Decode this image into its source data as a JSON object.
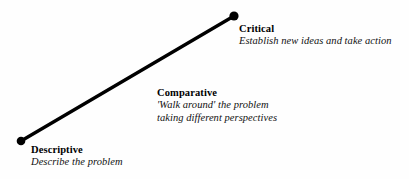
{
  "diagram": {
    "line_color": "#000000",
    "dot_color": "#000000",
    "background_color": "#fefefe",
    "axis": {
      "start_point": {
        "x": 21,
        "y": 141
      },
      "end_point": {
        "x": 234,
        "y": 16
      }
    },
    "stages": [
      {
        "id": "descriptive",
        "title": "Descriptive",
        "description_lines": [
          "Describe the problem"
        ]
      },
      {
        "id": "comparative",
        "title": "Comparative",
        "description_lines": [
          "'Walk around' the problem",
          "taking different perspectives"
        ]
      },
      {
        "id": "critical",
        "title": "Critical",
        "description_lines": [
          "Establish new ideas and take action"
        ]
      }
    ]
  }
}
